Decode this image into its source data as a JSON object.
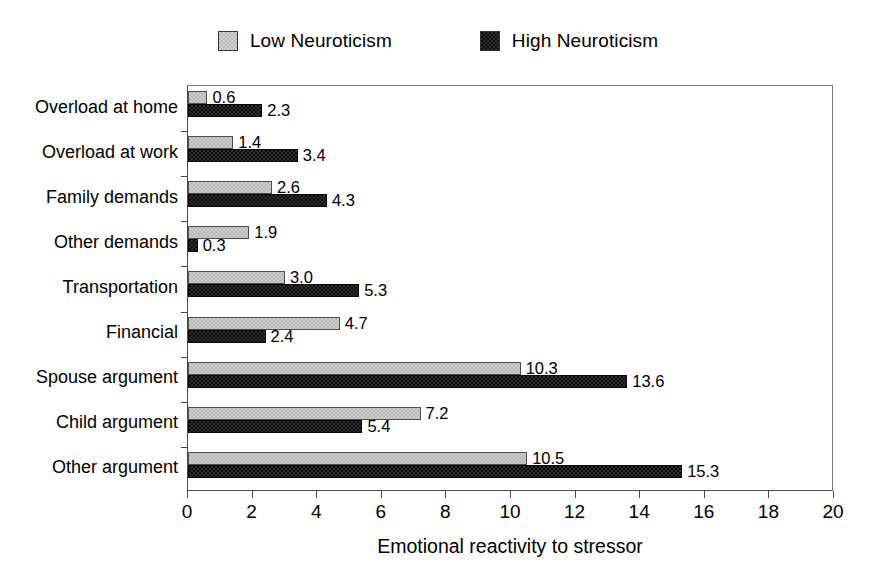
{
  "legend": {
    "entries": [
      {
        "label": "Low Neuroticism",
        "key": "low",
        "color": "#cbcbcb"
      },
      {
        "label": "High Neuroticism",
        "key": "high",
        "color": "#101010"
      }
    ]
  },
  "axis": {
    "x_title": "Emotional reactivity to stressor",
    "x_ticks": [
      "0",
      "2",
      "4",
      "6",
      "8",
      "10",
      "12",
      "14",
      "16",
      "18",
      "20"
    ]
  },
  "chart_data": {
    "type": "bar",
    "orientation": "horizontal",
    "title": "",
    "xlabel": "Emotional reactivity to stressor",
    "ylabel": "",
    "xlim": [
      0,
      20
    ],
    "xtick_step": 2,
    "grid": false,
    "legend_position": "top-center",
    "categories": [
      "Overload at home",
      "Overload at work",
      "Family demands",
      "Other demands",
      "Transportation",
      "Financial",
      "Spouse argument",
      "Child argument",
      "Other argument"
    ],
    "series": [
      {
        "name": "Low Neuroticism",
        "color": "#cbcbcb",
        "values": [
          0.6,
          1.4,
          2.6,
          1.9,
          3.0,
          4.7,
          10.3,
          7.2,
          10.5
        ],
        "labels": [
          "0.6",
          "1.4",
          "2.6",
          "1.9",
          "3.0",
          "4.7",
          "10.3",
          "7.2",
          "10.5"
        ]
      },
      {
        "name": "High Neuroticism",
        "color": "#101010",
        "values": [
          2.3,
          3.4,
          4.3,
          0.3,
          5.3,
          2.4,
          13.6,
          5.4,
          15.3
        ],
        "labels": [
          "2.3",
          "3.4",
          "4.3",
          "0.3",
          "5.3",
          "2.4",
          "13.6",
          "5.4",
          "15.3"
        ]
      }
    ]
  }
}
